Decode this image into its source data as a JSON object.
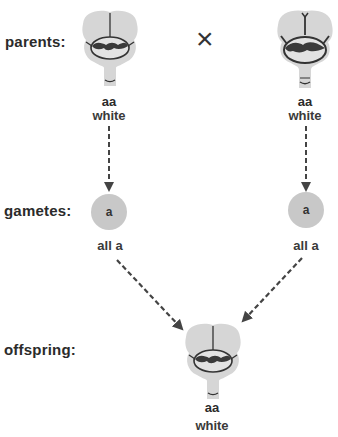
{
  "labels": {
    "parents": "parents:",
    "gametes": "gametes:",
    "offspring": "offspring:"
  },
  "cross_symbol": "×",
  "parents": [
    {
      "genotype": "aa",
      "phenotype": "white"
    },
    {
      "genotype": "aa",
      "phenotype": "white"
    }
  ],
  "gametes": [
    {
      "allele": "a",
      "note_prefix": "all ",
      "note_allele": "a"
    },
    {
      "allele": "a",
      "note_prefix": "all ",
      "note_allele": "a"
    }
  ],
  "offspring": {
    "genotype": "aa",
    "phenotype": "white"
  },
  "colors": {
    "flower_fill": "#d6d6d6",
    "outline": "#333333",
    "gamete_fill": "#c8c8c8",
    "arrow": "#444444"
  }
}
